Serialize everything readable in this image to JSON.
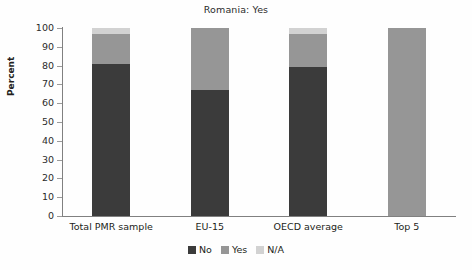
{
  "chart_data": {
    "type": "bar",
    "subtype": "stacked-vertical-100",
    "title": "Romania: Yes",
    "xlabel": "",
    "ylabel": "Percent",
    "ylim": [
      0,
      100
    ],
    "ytick_step": 10,
    "yticks": [
      "100",
      "90",
      "80",
      "70",
      "60",
      "50",
      "40",
      "30",
      "20",
      "10",
      "0"
    ],
    "grid": false,
    "legend_position": "bottom-center",
    "categories": [
      "Total PMR sample",
      "EU-15",
      "OECD average",
      "Top 5"
    ],
    "series": [
      {
        "name": "No",
        "color": "#3b3b3b",
        "values": [
          81,
          67,
          79,
          0
        ]
      },
      {
        "name": "Yes",
        "color": "#969696",
        "values": [
          16,
          33,
          18,
          100
        ]
      },
      {
        "name": "N/A",
        "color": "#d2d2d2",
        "values": [
          3,
          0,
          3,
          0
        ]
      }
    ],
    "legend": [
      {
        "label": "No",
        "color": "#3b3b3b"
      },
      {
        "label": "Yes",
        "color": "#969696"
      },
      {
        "label": "N/A",
        "color": "#d2d2d2"
      }
    ],
    "axis_color": "#808080",
    "background": "#fefefe"
  }
}
